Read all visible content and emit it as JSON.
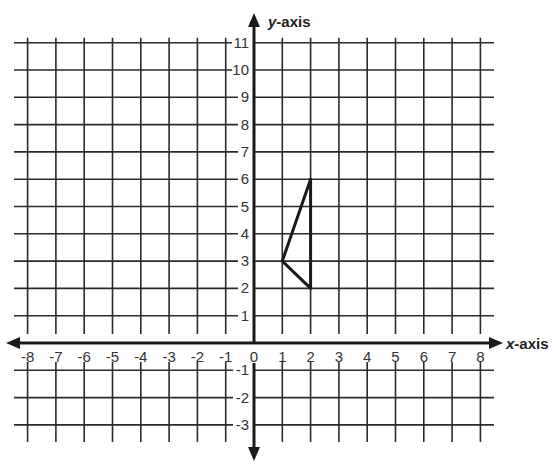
{
  "chart_data": {
    "type": "coordinate-grid",
    "xlabel_prefix": "x",
    "xlabel_suffix": "-axis",
    "ylabel_prefix": "y",
    "ylabel_suffix": "-axis",
    "xlim": [
      -8,
      8
    ],
    "ylim": [
      -3,
      11
    ],
    "x_ticks": [
      -8,
      -7,
      -6,
      -5,
      -4,
      -3,
      -2,
      -1,
      0,
      1,
      2,
      3,
      4,
      5,
      6,
      7,
      8
    ],
    "y_ticks": [
      11,
      10,
      9,
      8,
      7,
      6,
      5,
      4,
      3,
      2,
      1,
      -1,
      -2,
      -3
    ],
    "grid": true,
    "shape": {
      "type": "triangle",
      "vertices": [
        [
          2,
          6
        ],
        [
          1,
          3
        ],
        [
          2,
          2
        ]
      ]
    }
  },
  "colors": {
    "grid": "#2a2a2a",
    "axis": "#1a1a1a",
    "shape": "#1a1a1a"
  }
}
